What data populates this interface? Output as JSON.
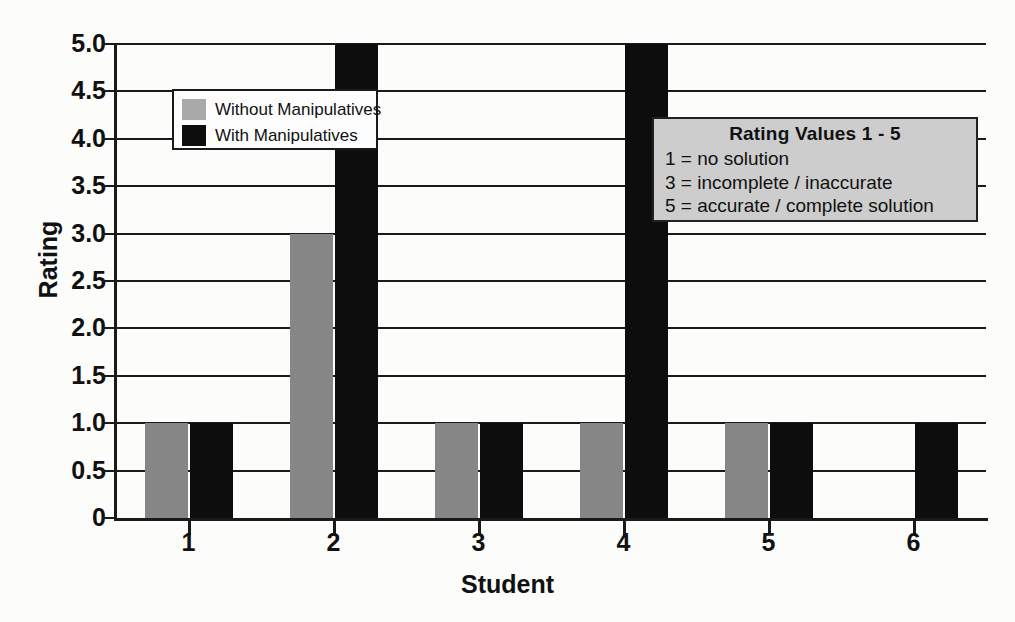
{
  "axes": {
    "y_title": "Rating",
    "x_title": "Student",
    "y_ticks": [
      "5.0",
      "4.5",
      "4.0",
      "3.5",
      "3.0",
      "2.5",
      "2.0",
      "1.5",
      "1.0",
      "0.5",
      "0"
    ],
    "x_ticks": [
      "1",
      "2",
      "3",
      "4",
      "5",
      "6"
    ]
  },
  "legend": {
    "items": [
      {
        "label": "Without Manipulatives",
        "color": "#a9a9a9"
      },
      {
        "label": "With Manipulatives",
        "color": "#0d0d0d"
      }
    ]
  },
  "infobox": {
    "title": "Rating Values 1 - 5",
    "lines": [
      "1 = no solution",
      "3 = incomplete / inaccurate",
      "5 = accurate / complete solution"
    ]
  },
  "chart_data": {
    "type": "bar",
    "title": "",
    "xlabel": "Student",
    "ylabel": "Rating",
    "ylim": [
      0,
      5
    ],
    "ytick_values": [
      5.0,
      4.5,
      4.0,
      3.5,
      3.0,
      2.5,
      2.0,
      1.5,
      1.0,
      0.5,
      0
    ],
    "grid": true,
    "legend_position": "upper-left-inside",
    "categories": [
      "1",
      "2",
      "3",
      "4",
      "5",
      "6"
    ],
    "series": [
      {
        "name": "Without Manipulatives",
        "color": "#868686",
        "values": [
          1,
          3,
          1,
          1,
          1,
          null
        ]
      },
      {
        "name": "With Manipulatives",
        "color": "#0d0d0d",
        "values": [
          1,
          5,
          1,
          5,
          1,
          1
        ]
      }
    ],
    "annotations": [
      "Rating Values 1 - 5",
      "1 = no solution",
      "3 = incomplete / inaccurate",
      "5 = accurate / complete solution"
    ]
  }
}
